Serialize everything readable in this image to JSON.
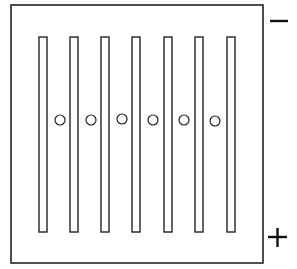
{
  "diagram": {
    "stroke_color": "#222222",
    "background": "#ffffff",
    "outer_box": {
      "x": 11,
      "y": 5,
      "width": 252,
      "height": 258
    },
    "bars": [
      {
        "x": 39,
        "y": 37,
        "width": 8,
        "height": 195
      },
      {
        "x": 70,
        "y": 37,
        "width": 8,
        "height": 195
      },
      {
        "x": 101,
        "y": 37,
        "width": 8,
        "height": 195
      },
      {
        "x": 132,
        "y": 37,
        "width": 8,
        "height": 195
      },
      {
        "x": 164,
        "y": 37,
        "width": 8,
        "height": 195
      },
      {
        "x": 195,
        "y": 37,
        "width": 8,
        "height": 195
      },
      {
        "x": 227,
        "y": 37,
        "width": 8,
        "height": 195
      }
    ],
    "holes": [
      {
        "cx": 60,
        "cy": 120,
        "r": 5
      },
      {
        "cx": 91,
        "cy": 120,
        "r": 5
      },
      {
        "cx": 122,
        "cy": 119,
        "r": 5
      },
      {
        "cx": 153,
        "cy": 120,
        "r": 5
      },
      {
        "cx": 184,
        "cy": 120,
        "r": 5
      },
      {
        "cx": 215,
        "cy": 121,
        "r": 5
      }
    ],
    "terminals": {
      "negative": {
        "symbol": "−",
        "label": "negative-terminal"
      },
      "positive": {
        "symbol": "+",
        "label": "positive-terminal"
      }
    }
  }
}
